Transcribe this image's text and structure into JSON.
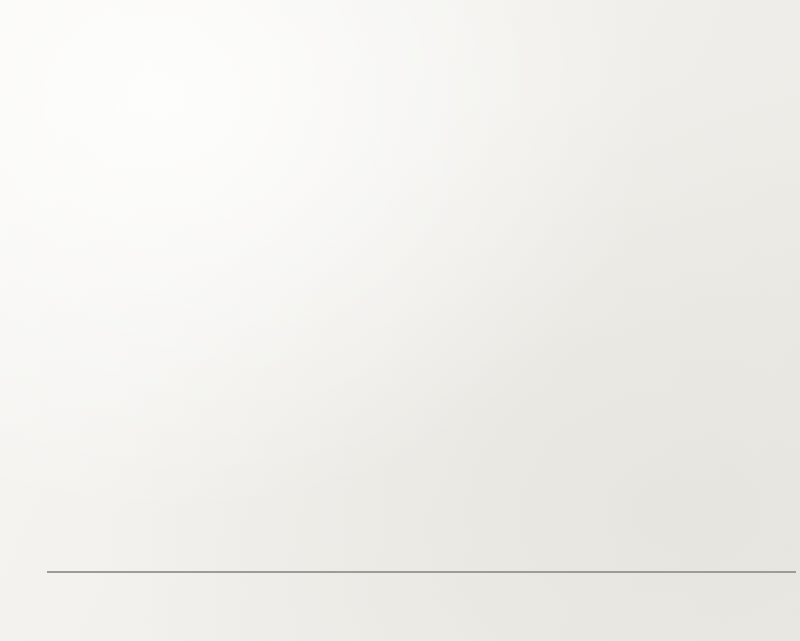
{
  "chart_data": {
    "type": "bar",
    "title": "",
    "xlabel": "",
    "ylabel": "% Support for Incumbent at T2",
    "ylim": [
      0,
      100
    ],
    "ytick_labels": [
      "100",
      "90",
      "80",
      "70",
      "60",
      "50",
      "40",
      "30",
      "20",
      "10",
      "0"
    ],
    "ytick_values": [
      100,
      90,
      80,
      70,
      60,
      50,
      40,
      30,
      20,
      10,
      0
    ],
    "grid": true,
    "legend_position": "bottom",
    "categories": [
      "2018 Toronto",
      "2004 CES",
      "2006 CES",
      "2008 CES",
      "2011 CES",
      "2015 CES"
    ],
    "series": [
      {
        "name": "Voted for Incumbent at T1",
        "color": "#181818",
        "values": [
          69.3,
          91.7,
          94.1,
          89.0,
          91.0,
          95.8
        ]
      },
      {
        "name": "Voted for Other at T1",
        "color": "#9b9b9b",
        "values": [
          24.7,
          34.7,
          44.4,
          20.4,
          13.1,
          33.3
        ]
      }
    ]
  },
  "legend": {
    "items": [
      {
        "label": "Voted for Incumbent at T1",
        "marker": "square-black"
      },
      {
        "label": "Voted for Other at T1",
        "marker": "square-gray"
      }
    ]
  },
  "bleed_through": {
    "lines": [
      {
        "text": "Other",
        "x": 690,
        "y": 24,
        "size": 17
      },
      {
        "text": "vo ta",
        "x": 726,
        "y": 86,
        "size": 15
      },
      {
        "text": "80",
        "x": 700,
        "y": 88,
        "size": 14
      },
      {
        "text": "Cited",
        "x": 712,
        "y": 128,
        "size": 16
      },
      {
        "text": "of",
        "x": 754,
        "y": 158,
        "size": 15
      },
      {
        "text": "ting to a third of 2011 CES voters. Third of the party. Implicitly",
        "x": 106,
        "y": 297,
        "size": 16
      },
      {
        "text": "might the other party, relying on the public alone indicates that",
        "x": 110,
        "y": 324,
        "size": 16
      },
      {
        "text": "community of a particular",
        "x": 112,
        "y": 352,
        "size": 16
      },
      {
        "text": "At this point, in every case the party is a dependency",
        "x": 108,
        "y": 382,
        "size": 16
      },
      {
        "text": "voting as in column of both the 2004 CES, percentage continu-",
        "x": 108,
        "y": 412,
        "size": 16
      },
      {
        "text": "ing their vote in column C. Relying in the 2004 CES and not",
        "x": 112,
        "y": 440,
        "size": 16
      },
      {
        "text": "In the other hand, the analysis of our 2015 group, the",
        "x": 110,
        "y": 470,
        "size": 16
      },
      {
        "text": "that the 2011 CES reliability, which appears to be more rare",
        "x": 114,
        "y": 498,
        "size": 16
      },
      {
        "text": "over the time at least by the 2015 CES group",
        "x": 110,
        "y": 526,
        "size": 16
      },
      {
        "text": "incumbent",
        "x": 690,
        "y": 544,
        "size": 15
      }
    ]
  },
  "layout": {
    "plot_top": 13,
    "plot_bottom": 572,
    "plot_left": 70,
    "plot_right": 796
  }
}
